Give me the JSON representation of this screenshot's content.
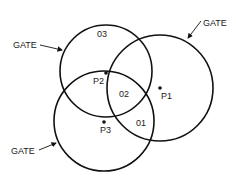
{
  "diagram": {
    "gate_labels": {
      "top_left": "GATE",
      "top_right": "GATE",
      "bottom_left": "GATE"
    },
    "region_labels": {
      "o3": "03",
      "o2": "02",
      "o1": "01"
    },
    "points": {
      "p1": "P1",
      "p2": "P2",
      "p3": "P3"
    },
    "colors": {
      "stroke": "#111111",
      "background": "#ffffff"
    }
  }
}
